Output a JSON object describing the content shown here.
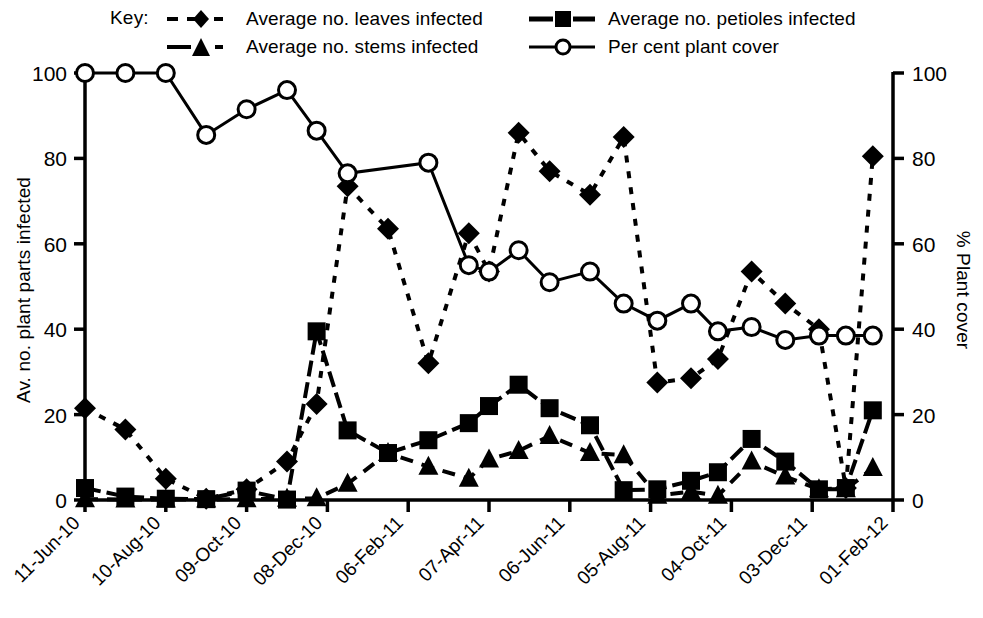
{
  "legend": {
    "key_label": "Key:",
    "entries": [
      {
        "label": "Average no. leaves infected",
        "symbol": "filled-diamond",
        "line": "dotted"
      },
      {
        "label": "Average no. petioles infected",
        "symbol": "filled-square",
        "line": "solid-short"
      },
      {
        "label": "Average no. stems infected",
        "symbol": "filled-triangle",
        "line": "dashed"
      },
      {
        "label": "Per cent plant cover",
        "symbol": "open-circle",
        "line": "solid"
      }
    ]
  },
  "axes": {
    "y_left_title": "Av. no. plant parts infected",
    "y_right_title": "% Plant cover",
    "y_left_ticks": [
      "0",
      "20",
      "40",
      "60",
      "80",
      "100"
    ],
    "y_right_ticks": [
      "0",
      "20",
      "40",
      "60",
      "80",
      "100"
    ],
    "x_ticks": [
      "11-Jun-10",
      "10-Aug-10",
      "09-Oct-10",
      "08-Dec-10",
      "06-Feb-11",
      "07-Apr-11",
      "06-Jun-11",
      "05-Aug-11",
      "04-Oct-11",
      "03-Dec-11",
      "01-Feb-12"
    ]
  },
  "colors": {
    "ink": "#000000",
    "background": "#ffffff"
  },
  "chart_data": {
    "type": "line",
    "title": "",
    "xlabel": "",
    "ylabel": "Av. no. plant parts infected",
    "y2label": "% Plant cover",
    "ylim": [
      0,
      100
    ],
    "y2lim": [
      0,
      100
    ],
    "grid": false,
    "legend_position": "top",
    "x_tick_labels": [
      "11-Jun-10",
      "10-Aug-10",
      "09-Oct-10",
      "08-Dec-10",
      "06-Feb-11",
      "07-Apr-11",
      "06-Jun-11",
      "05-Aug-11",
      "04-Oct-11",
      "03-Dec-11",
      "01-Feb-12"
    ],
    "x_tick_days": [
      0,
      60,
      120,
      180,
      240,
      300,
      360,
      420,
      480,
      540,
      600
    ],
    "x_range_days": [
      0,
      600
    ],
    "series": [
      {
        "name": "Average no. leaves infected",
        "axis": "left",
        "marker": "filled-diamond",
        "line": "dotted",
        "x_days": [
          0,
          30,
          60,
          90,
          120,
          150,
          172,
          195,
          225,
          255,
          285,
          300,
          322,
          345,
          375,
          400,
          425,
          450,
          470,
          495,
          520,
          545,
          565,
          585
        ],
        "values": [
          21.5,
          16.5,
          5.0,
          0.3,
          2.5,
          9.0,
          22.5,
          73.5,
          63.5,
          32.0,
          62.5,
          53.5,
          86.0,
          77.0,
          71.5,
          85.0,
          27.5,
          28.5,
          33.0,
          53.5,
          46.0,
          40.0,
          2.8,
          80.5
        ]
      },
      {
        "name": "Average no. petioles infected",
        "axis": "left",
        "marker": "filled-square",
        "line": "solid-short",
        "x_days": [
          0,
          30,
          60,
          90,
          120,
          150,
          172,
          195,
          225,
          255,
          285,
          300,
          322,
          345,
          375,
          400,
          425,
          450,
          470,
          495,
          520,
          545,
          565,
          585
        ],
        "values": [
          2.8,
          0.8,
          0.3,
          0.2,
          2.2,
          0.1,
          39.5,
          16.3,
          11.0,
          14.0,
          18.0,
          22.0,
          27.0,
          21.5,
          17.5,
          2.3,
          2.5,
          4.5,
          6.5,
          14.3,
          9.0,
          2.5,
          2.8,
          21.0
        ]
      },
      {
        "name": "Average no. stems infected",
        "axis": "left",
        "marker": "filled-triangle",
        "line": "dashed",
        "x_days": [
          0,
          30,
          60,
          90,
          120,
          150,
          172,
          195,
          225,
          255,
          285,
          300,
          322,
          345,
          375,
          400,
          425,
          450,
          470,
          495,
          520,
          545,
          565,
          585
        ],
        "values": [
          0.2,
          0.1,
          0.1,
          0.1,
          0.2,
          0.3,
          0.4,
          3.8,
          11.0,
          7.8,
          5.0,
          9.5,
          11.5,
          15.0,
          11.0,
          10.5,
          1.0,
          2.0,
          1.0,
          9.0,
          5.5,
          2.5,
          2.5,
          7.5
        ]
      },
      {
        "name": "Per cent plant cover",
        "axis": "right",
        "marker": "open-circle",
        "line": "solid",
        "x_days": [
          0,
          30,
          60,
          90,
          120,
          150,
          172,
          195,
          255,
          285,
          300,
          322,
          345,
          375,
          400,
          425,
          450,
          470,
          495,
          520,
          545,
          565,
          585
        ],
        "values": [
          100,
          100,
          100,
          85.5,
          91.5,
          96.0,
          86.5,
          76.5,
          79.0,
          55.0,
          53.5,
          58.5,
          51.0,
          53.5,
          46.0,
          42.0,
          46.0,
          39.5,
          40.5,
          37.5,
          38.5,
          38.5,
          38.5
        ]
      }
    ]
  }
}
